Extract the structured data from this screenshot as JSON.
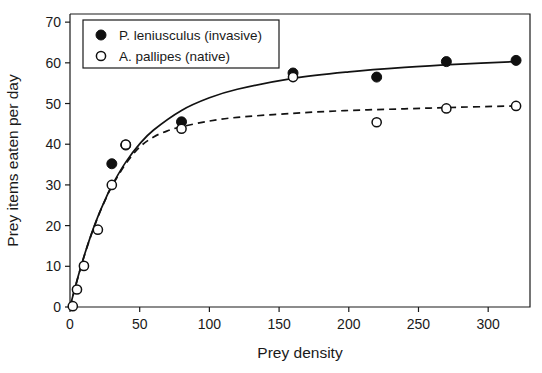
{
  "chart_data": {
    "type": "scatter",
    "title": "",
    "xlabel": "Prey density",
    "ylabel": "Prey items eaten per day",
    "xlim": [
      0,
      330
    ],
    "ylim": [
      0,
      72
    ],
    "xticks": [
      0,
      50,
      100,
      150,
      200,
      250,
      300
    ],
    "yticks": [
      0,
      10,
      20,
      30,
      40,
      50,
      60,
      70
    ],
    "grid": false,
    "legend_position": "top-left",
    "series": [
      {
        "name": "P. leniusculus (invasive)",
        "marker": "filled-circle",
        "line_style": "solid",
        "color": "#101010",
        "points": [
          {
            "x": 30,
            "y": 35.2
          },
          {
            "x": 40,
            "y": 39.8
          },
          {
            "x": 80,
            "y": 45.5
          },
          {
            "x": 160,
            "y": 57.5
          },
          {
            "x": 220,
            "y": 56.5
          },
          {
            "x": 270,
            "y": 60.3
          },
          {
            "x": 320,
            "y": 60.6
          }
        ],
        "fit_curve": [
          {
            "x": 0,
            "y": 0
          },
          {
            "x": 5,
            "y": 6.5
          },
          {
            "x": 10,
            "y": 12.4
          },
          {
            "x": 15,
            "y": 17.6
          },
          {
            "x": 20,
            "y": 22.2
          },
          {
            "x": 25,
            "y": 26.2
          },
          {
            "x": 30,
            "y": 29.8
          },
          {
            "x": 40,
            "y": 35.6
          },
          {
            "x": 50,
            "y": 40.1
          },
          {
            "x": 60,
            "y": 43.5
          },
          {
            "x": 80,
            "y": 48.3
          },
          {
            "x": 100,
            "y": 51.4
          },
          {
            "x": 120,
            "y": 53.5
          },
          {
            "x": 160,
            "y": 56.2
          },
          {
            "x": 200,
            "y": 57.8
          },
          {
            "x": 240,
            "y": 58.9
          },
          {
            "x": 280,
            "y": 59.7
          },
          {
            "x": 320,
            "y": 60.3
          }
        ]
      },
      {
        "name": "A. pallipes (native)",
        "marker": "open-circle",
        "line_style": "dashed",
        "color": "#101010",
        "points": [
          {
            "x": 2,
            "y": 0.2
          },
          {
            "x": 5,
            "y": 4.3
          },
          {
            "x": 10,
            "y": 10.1
          },
          {
            "x": 20,
            "y": 19.0
          },
          {
            "x": 30,
            "y": 30.0
          },
          {
            "x": 40,
            "y": 39.9
          },
          {
            "x": 80,
            "y": 43.8
          },
          {
            "x": 160,
            "y": 56.5
          },
          {
            "x": 220,
            "y": 45.4
          },
          {
            "x": 270,
            "y": 48.8
          },
          {
            "x": 320,
            "y": 49.4
          }
        ],
        "fit_curve": [
          {
            "x": 0,
            "y": 0
          },
          {
            "x": 5,
            "y": 6.4
          },
          {
            "x": 10,
            "y": 12.3
          },
          {
            "x": 15,
            "y": 17.5
          },
          {
            "x": 20,
            "y": 22.1
          },
          {
            "x": 25,
            "y": 26.1
          },
          {
            "x": 30,
            "y": 29.6
          },
          {
            "x": 40,
            "y": 35.2
          },
          {
            "x": 50,
            "y": 39.3
          },
          {
            "x": 60,
            "y": 41.8
          },
          {
            "x": 70,
            "y": 43.3
          },
          {
            "x": 80,
            "y": 44.3
          },
          {
            "x": 100,
            "y": 45.7
          },
          {
            "x": 120,
            "y": 46.6
          },
          {
            "x": 160,
            "y": 47.6
          },
          {
            "x": 200,
            "y": 48.3
          },
          {
            "x": 240,
            "y": 48.7
          },
          {
            "x": 280,
            "y": 49.1
          },
          {
            "x": 320,
            "y": 49.4
          }
        ]
      }
    ]
  },
  "legend": {
    "entries": [
      {
        "label": "P. leniusculus (invasive)",
        "marker": "filled-circle"
      },
      {
        "label": "A. pallipes (native)",
        "marker": "open-circle"
      }
    ]
  }
}
